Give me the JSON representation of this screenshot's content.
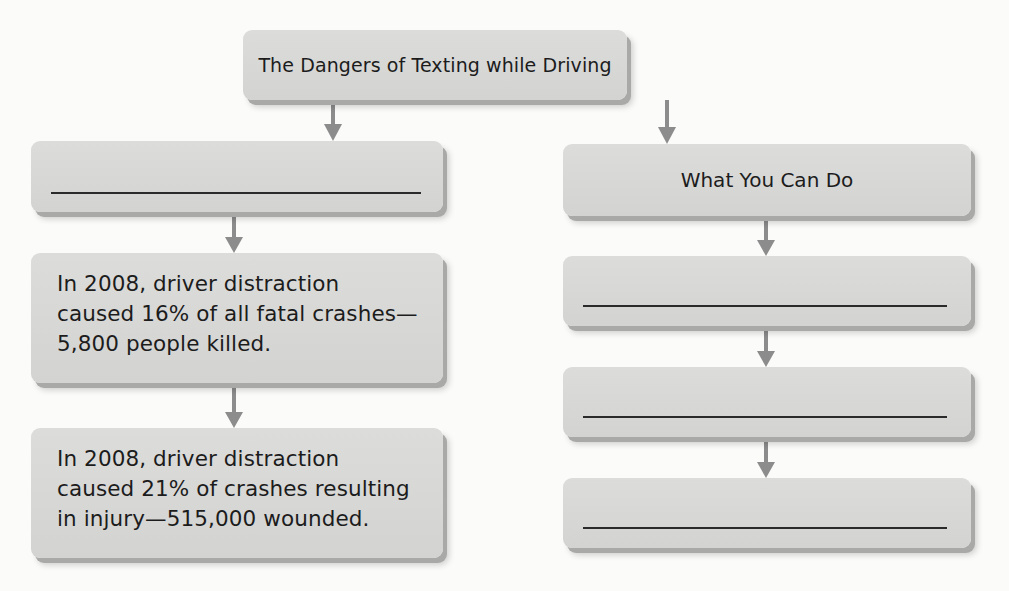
{
  "diagram": {
    "type": "flowchart",
    "title": "The Dangers of Texting while Driving",
    "left_branch": {
      "boxes": [
        {
          "id": "left-1",
          "text": "",
          "blank": true
        },
        {
          "id": "left-2",
          "lines": [
            "In 2008, driver distraction",
            "caused 16% of all fatal crashes—",
            "5,800 people killed."
          ]
        },
        {
          "id": "left-3",
          "lines": [
            "In 2008, driver distraction",
            "caused 21% of crashes resulting",
            "in injury—515,000 wounded."
          ]
        }
      ]
    },
    "right_branch": {
      "heading": "What You Can Do",
      "boxes": [
        {
          "id": "right-1",
          "text": "",
          "blank": true
        },
        {
          "id": "right-2",
          "text": "",
          "blank": true
        },
        {
          "id": "right-3",
          "text": "",
          "blank": true
        }
      ]
    },
    "colors": {
      "box_fill": "#d6d6d5",
      "box_shadow": "#a9a9a8",
      "arrow": "#8c8c8c",
      "text": "#1c1c1c",
      "background": "#fbfbfa"
    }
  }
}
